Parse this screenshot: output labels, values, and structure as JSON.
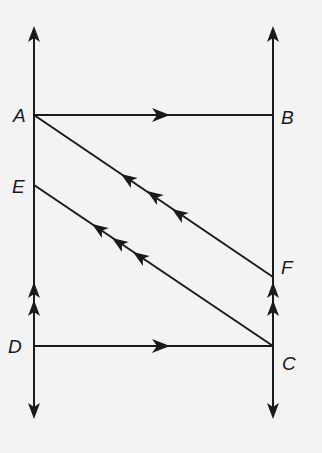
{
  "diagram": {
    "type": "geometry-parallel-lines",
    "colors": {
      "stroke": "#1a1a1a",
      "background": "#f3f3f3"
    },
    "points": {
      "A": {
        "label": "A",
        "x": 34,
        "y": 115
      },
      "B": {
        "label": "B",
        "x": 273,
        "y": 115
      },
      "E": {
        "label": "E",
        "x": 34,
        "y": 185
      },
      "F": {
        "label": "F",
        "x": 273,
        "y": 277
      },
      "D": {
        "label": "D",
        "x": 34,
        "y": 346
      },
      "C": {
        "label": "C",
        "x": 273,
        "y": 346
      }
    },
    "lines": [
      {
        "name": "left-vertical-line",
        "from": "top-arrow",
        "to": "bottom-arrow",
        "parallel_marks": 2,
        "both_ends_arrows": true
      },
      {
        "name": "right-vertical-line",
        "from": "top-arrow",
        "to": "bottom-arrow",
        "parallel_marks": 2,
        "both_ends_arrows": true
      },
      {
        "name": "segment-AB",
        "from": "A",
        "to": "B",
        "parallel_marks": 1
      },
      {
        "name": "segment-DC",
        "from": "D",
        "to": "C",
        "parallel_marks": 1
      },
      {
        "name": "segment-AF",
        "from": "A",
        "to": "F",
        "parallel_marks": 3
      },
      {
        "name": "segment-EC",
        "from": "E",
        "to": "C",
        "parallel_marks": 3
      }
    ]
  }
}
